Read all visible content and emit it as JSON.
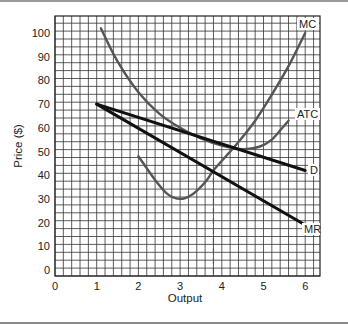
{
  "chart_data": {
    "type": "line",
    "title": "",
    "xlabel": "Output",
    "ylabel": "Price ($)",
    "xlim": [
      0,
      6.3
    ],
    "ylim": [
      0,
      106
    ],
    "grid": true,
    "x_ticks": [
      "0",
      "1",
      "2",
      "3",
      "4",
      "5",
      "6"
    ],
    "y_ticks": [
      "0",
      "10",
      "20",
      "30",
      "40",
      "50",
      "60",
      "70",
      "80",
      "90",
      "100"
    ],
    "series": [
      {
        "name": "MC",
        "color": "#555555",
        "points": [
          [
            2.0,
            48
          ],
          [
            2.4,
            38
          ],
          [
            2.7,
            32
          ],
          [
            3.0,
            30
          ],
          [
            3.3,
            32
          ],
          [
            3.6,
            37
          ],
          [
            3.8,
            42
          ],
          [
            4.1,
            48
          ],
          [
            4.4,
            54
          ],
          [
            4.8,
            63
          ],
          [
            5.2,
            74
          ],
          [
            5.6,
            86
          ],
          [
            6.0,
            100
          ]
        ]
      },
      {
        "name": "ATC",
        "color": "#555555",
        "points": [
          [
            1.1,
            102
          ],
          [
            1.5,
            88
          ],
          [
            2.0,
            75
          ],
          [
            2.5,
            66
          ],
          [
            3.0,
            60
          ],
          [
            3.5,
            55.5
          ],
          [
            4.0,
            52.5
          ],
          [
            4.5,
            51
          ],
          [
            4.9,
            52
          ],
          [
            5.2,
            55
          ],
          [
            5.5,
            61
          ],
          [
            5.6,
            63
          ]
        ]
      },
      {
        "name": "D",
        "color": "#111111",
        "points": [
          [
            1.0,
            70
          ],
          [
            6.0,
            42
          ]
        ]
      },
      {
        "name": "MR",
        "color": "#111111",
        "points": [
          [
            1.0,
            70
          ],
          [
            6.0,
            19
          ]
        ]
      }
    ],
    "annotations": [
      {
        "type": "dashed-vline",
        "x": 3.8,
        "y_from": 0,
        "y_to": 42
      }
    ]
  },
  "labels": {
    "x_axis": "Output",
    "y_axis": "Price ($)",
    "mc": "MC",
    "atc": "ATC",
    "d": "D",
    "mr": "MR",
    "x_ticks": [
      "0",
      "1",
      "2",
      "3",
      "4",
      "5",
      "6"
    ],
    "y_ticks": [
      "0",
      "10",
      "20",
      "30",
      "40",
      "50",
      "60",
      "70",
      "80",
      "90",
      "100"
    ]
  }
}
